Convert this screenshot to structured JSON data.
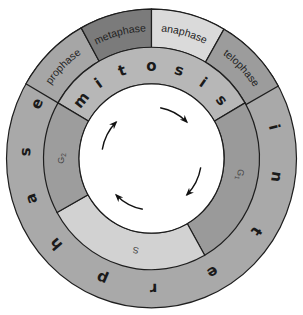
{
  "diagram": {
    "center": [
      151.5,
      158.5
    ],
    "radii": {
      "outer": 145,
      "middle": 108,
      "inner": 72.5
    },
    "colors": {
      "outline": "#1e1e1e",
      "interphase_ring": "#a9a9a9",
      "mitosis_ring": "#b7b7b7",
      "prophase": "#a6a6a6",
      "metaphase": "#7b7b7b",
      "anaphase": "#dadada",
      "telophase": "#9c9c9c",
      "g2": "#9d9d9d",
      "s": "#d2d2d2",
      "g1": "#9a9a9a",
      "center": "#ffffff",
      "arrow": "#111111"
    },
    "outer_ring": {
      "segments": [
        {
          "id": "prophase",
          "label": "prophase",
          "start": 210,
          "end": 241
        },
        {
          "id": "metaphase",
          "label": "metaphase",
          "start": 241,
          "end": 270
        },
        {
          "id": "anaphase",
          "label": "anaphase",
          "start": 270,
          "end": 300
        },
        {
          "id": "telophase",
          "label": "telophase",
          "start": 300,
          "end": 331
        }
      ],
      "interphase_word": "interphase",
      "interphase_letters": [
        "i",
        "n",
        "t",
        "e",
        "r",
        "p",
        "h",
        "a",
        "s",
        "e"
      ]
    },
    "middle_ring": {
      "mitosis_word": "mitosis",
      "mitosis_letters": [
        "m",
        "i",
        "t",
        "o",
        "s",
        "i",
        "s"
      ],
      "segments": [
        {
          "id": "mitosis",
          "label": "mitosis",
          "start": 210,
          "end": 330
        },
        {
          "id": "g1",
          "label": "G1",
          "main": "G",
          "sub": "1",
          "start": -30,
          "end": 60.5
        },
        {
          "id": "s",
          "label": "S",
          "start": 60.5,
          "end": 151
        },
        {
          "id": "g2",
          "label": "G2",
          "main": "G",
          "sub": "2",
          "start": 151,
          "end": 210
        }
      ]
    },
    "arrows": {
      "count": 4,
      "direction": "clockwise"
    }
  }
}
